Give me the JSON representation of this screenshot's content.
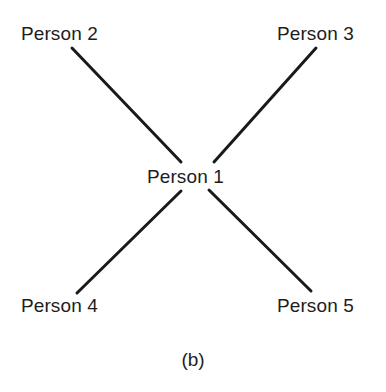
{
  "figure": {
    "caption": "(b)",
    "background_color": "#ffffff",
    "line_color": "#1a1a1a",
    "text_color": "#1d1d1d",
    "line_width": 3
  },
  "nodes": [
    {
      "id": "person-1",
      "label": "Person 1",
      "x": 197,
      "y": 177,
      "role": "hub"
    },
    {
      "id": "person-2",
      "label": "Person 2",
      "x": 65,
      "y": 34,
      "role": "spoke"
    },
    {
      "id": "person-3",
      "label": "Person 3",
      "x": 321,
      "y": 34,
      "role": "spoke"
    },
    {
      "id": "person-4",
      "label": "Person 4",
      "x": 65,
      "y": 306,
      "role": "spoke"
    },
    {
      "id": "person-5",
      "label": "Person 5",
      "x": 321,
      "y": 306,
      "role": "spoke"
    }
  ],
  "edges": [
    {
      "id": "edge-person1-person2",
      "from": "person-1",
      "to": "person-2",
      "x1": 181,
      "y1": 162,
      "x2": 72,
      "y2": 48
    },
    {
      "id": "edge-person1-person3",
      "from": "person-1",
      "to": "person-3",
      "x1": 214,
      "y1": 162,
      "x2": 316,
      "y2": 48
    },
    {
      "id": "edge-person1-person4",
      "from": "person-1",
      "to": "person-4",
      "x1": 181,
      "y1": 191,
      "x2": 77,
      "y2": 293
    },
    {
      "id": "edge-person1-person5",
      "from": "person-1",
      "to": "person-5",
      "x1": 209,
      "y1": 190,
      "x2": 311,
      "y2": 291
    }
  ]
}
